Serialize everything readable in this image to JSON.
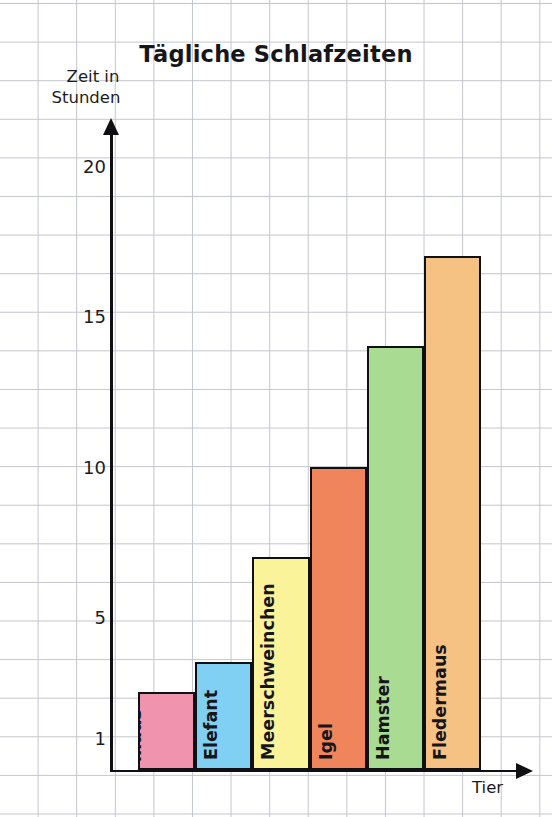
{
  "chart_data": {
    "type": "bar",
    "title": "Tägliche Schlafzeiten",
    "ylabel": "Zeit in\nStunden",
    "ylabel_line1": "Zeit in",
    "ylabel_line2": "Stunden",
    "xlabel": "Tier",
    "categories": [
      "Spitz-\nmaus",
      "Elefant",
      "Meerschweinchen",
      "Igel",
      "Hamster",
      "Fledermaus"
    ],
    "values": [
      2.5,
      3.5,
      7,
      10,
      14,
      17
    ],
    "ytick_labels": [
      "20",
      "15",
      "10",
      "5",
      "1"
    ],
    "ytick_values": [
      20,
      15,
      10,
      5,
      1
    ],
    "ylim": [
      0,
      21
    ],
    "grid": true,
    "legend": "none",
    "bar_colors": [
      "#f093ae",
      "#7fd0f2",
      "#fbf39a",
      "#f0855c",
      "#a9dc92",
      "#f5c283"
    ],
    "bar_border_color": "#101014",
    "grid_color": "#b9bcc4",
    "axis_color": "#101014"
  },
  "chart": {
    "title": "Tägliche Schlafzeiten",
    "y_axis_caption_line1": "Zeit in",
    "y_axis_caption_line2": "Stunden",
    "x_axis_caption": "Tier",
    "bars": [
      {
        "label": "Spitz-\nmaus",
        "label_line1": "Spitz-",
        "label_line2": "maus",
        "value": 2.5,
        "color": "#f093ae",
        "two_line": true
      },
      {
        "label": "Elefant",
        "value": 3.5,
        "color": "#7fd0f2",
        "two_line": false
      },
      {
        "label": "Meerschweinchen",
        "value": 7,
        "color": "#fbf39a",
        "two_line": false
      },
      {
        "label": "Igel",
        "value": 10,
        "color": "#f0855c",
        "two_line": false
      },
      {
        "label": "Hamster",
        "value": 14,
        "color": "#a9dc92",
        "two_line": false
      },
      {
        "label": "Fledermaus",
        "value": 17,
        "color": "#f5c283",
        "two_line": false
      }
    ],
    "y_ticks": [
      {
        "label": "20",
        "value": 20
      },
      {
        "label": "15",
        "value": 15
      },
      {
        "label": "10",
        "value": 10
      },
      {
        "label": "5",
        "value": 5
      },
      {
        "label": "1",
        "value": 1
      }
    ]
  }
}
